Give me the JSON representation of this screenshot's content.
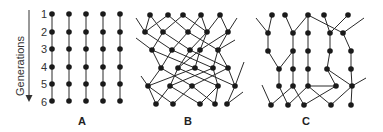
{
  "axis": {
    "label": "Generations",
    "generations": [
      "1",
      "2",
      "3",
      "4",
      "5",
      "6"
    ]
  },
  "panels": [
    {
      "label": "A",
      "description": "Non-recombining lineages: five straight vertical lines across six generations"
    },
    {
      "label": "B",
      "description": "Fully recombining lineages: network with crossing edges across six generations"
    },
    {
      "label": "C",
      "description": "Partially recombining lineages: mostly vertical lines with occasional crossing edges"
    }
  ],
  "colors": {
    "node": "#1a1a1a",
    "edge": "#2a2a2a",
    "background": "#ffffff"
  }
}
